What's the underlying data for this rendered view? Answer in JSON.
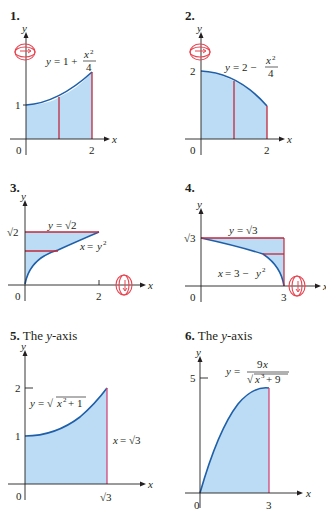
{
  "colors": {
    "fill": "#bcdcf5",
    "curve": "#1f5fa8",
    "slice": "#c0283c",
    "axis": "#231f20",
    "rotation_icon": "#e8434f"
  },
  "problems": [
    {
      "number": "1.",
      "caption": "",
      "equation": "y = 1 + x²/4",
      "eq_lhs": "y = 1 +",
      "eq_num": "x²",
      "eq_den": "4",
      "x_label": "x",
      "y_label": "y",
      "origin": "0",
      "ticks_x": [
        "2"
      ],
      "ticks_y": [
        "1"
      ],
      "rotation_axis": "y-axis"
    },
    {
      "number": "2.",
      "caption": "",
      "equation": "y = 2 − x²/4",
      "eq_lhs": "y = 2 −",
      "eq_num": "x²",
      "eq_den": "4",
      "x_label": "x",
      "y_label": "y",
      "origin": "0",
      "ticks_x": [
        "2"
      ],
      "ticks_y": [
        "2"
      ],
      "rotation_axis": "y-axis"
    },
    {
      "number": "3.",
      "caption": "",
      "equations": [
        "y = √2",
        "x = y²"
      ],
      "x_label": "x",
      "y_label": "y",
      "origin": "0",
      "ticks_x": [
        "2"
      ],
      "ticks_y": [
        "√2"
      ],
      "rotation_axis": "x-axis"
    },
    {
      "number": "4.",
      "caption": "",
      "equations": [
        "y = √3",
        "x = 3 − y²"
      ],
      "x_label": "x",
      "y_label": "y",
      "origin": "0",
      "ticks_x": [
        "3"
      ],
      "ticks_y": [
        "√3"
      ],
      "rotation_axis": "x-axis"
    },
    {
      "number": "5.",
      "caption": "The y-axis",
      "caption_pre": "The ",
      "caption_it": "y",
      "caption_post": "-axis",
      "equations": [
        "y = √(x² + 1)",
        "x = √3"
      ],
      "x_label": "x",
      "y_label": "y",
      "origin": "0",
      "ticks_x": [
        "√3"
      ],
      "ticks_y": [
        "1",
        "2"
      ]
    },
    {
      "number": "6.",
      "caption": "The y-axis",
      "caption_pre": "The ",
      "caption_it": "y",
      "caption_post": "-axis",
      "equation": "y = 9x / √(x³ + 9)",
      "eq_lhs": "y =",
      "eq_num": "9x",
      "eq_den": "√(x³ + 9)",
      "x_label": "x",
      "y_label": "y",
      "origin": "0",
      "ticks_x": [
        "3"
      ],
      "ticks_y": [
        "5"
      ]
    }
  ]
}
